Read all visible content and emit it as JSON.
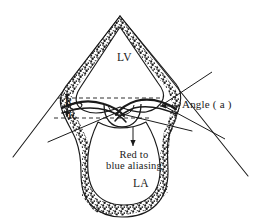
{
  "figure": {
    "type": "echocardiography-pisa-diagram",
    "title": "",
    "background_color": "#ffffff",
    "ink_color": "#1a1a1a",
    "view": "apical four-chamber sector scan"
  },
  "labels": {
    "lv": "LV",
    "la": "LA",
    "angle": "Angle ( a )",
    "aliasing_line1": "Red to",
    "aliasing_line2": "blue aliasing",
    "radius_upper": "R",
    "radius_lower": "R"
  },
  "annotations": {
    "dashed_line_upper_y": 98,
    "dashed_line_lower_y": 118,
    "angle_vertex": {
      "x": 162,
      "y": 105
    },
    "aliasing_arrow": {
      "x": 133,
      "y": 147
    }
  },
  "geometry": {
    "sector_apex": {
      "x": 120,
      "y": 16
    },
    "sector_left_end": {
      "x": 12,
      "y": 158
    },
    "sector_right_end": {
      "x": 249,
      "y": 176
    }
  }
}
